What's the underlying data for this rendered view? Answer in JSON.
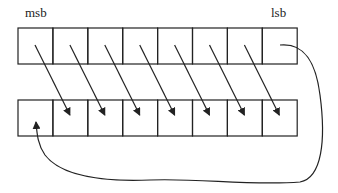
{
  "diagram": {
    "type": "bit-rotation",
    "labels": {
      "msb": "msb",
      "lsb": "lsb"
    },
    "bits": 8,
    "top_register": {
      "x": 18,
      "y": 28,
      "cell_width": 34.9,
      "cell_height": 36
    },
    "bottom_register": {
      "x": 18,
      "y": 100,
      "cell_width": 34.9,
      "cell_height": 36
    },
    "shift_direction": "right",
    "wraparound": "lsb to msb",
    "colors": {
      "stroke": "#222222",
      "background": "#ffffff"
    }
  }
}
